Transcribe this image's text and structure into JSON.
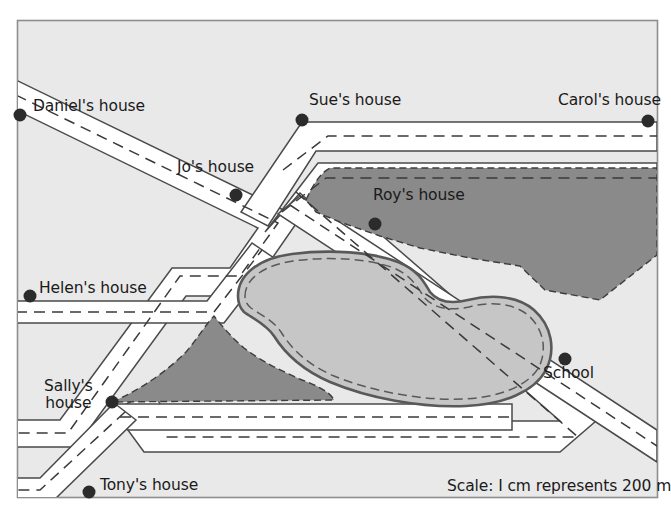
{
  "map": {
    "frame": {
      "x": 17,
      "y": 20,
      "width": 641,
      "height": 478
    },
    "background_color": "#e9e9e9",
    "frame_border_color": "#8e8e8e",
    "road_fill_color": "#ffffff",
    "road_edge_color": "#4a4a4a",
    "road_centerline_color": "#3a3a3a",
    "woodland_color": "#8a8a8a",
    "woodland_edge_color": "#3d3d3d",
    "lake_fill_color": "#c6c6c6",
    "lake_edge_color": "#595959",
    "marker_color": "#2b2b2b",
    "text_color": "#1a1a1a"
  },
  "places": [
    {
      "name": "daniel",
      "label": "Daniel's house",
      "dot_x": 20,
      "dot_y": 115,
      "label_x": 33,
      "label_y": 98,
      "two_line": false
    },
    {
      "name": "sue",
      "label": "Sue's house",
      "dot_x": 302,
      "dot_y": 120,
      "label_x": 309,
      "label_y": 92,
      "two_line": false
    },
    {
      "name": "carol",
      "label": "Carol's house",
      "dot_x": 648,
      "dot_y": 121,
      "label_x": 558,
      "label_y": 92,
      "two_line": false
    },
    {
      "name": "jo",
      "label": "Jo's house",
      "dot_x": 236,
      "dot_y": 195,
      "label_x": 177,
      "label_y": 159,
      "two_line": false
    },
    {
      "name": "roy",
      "label": "Roy's house",
      "dot_x": 375,
      "dot_y": 224,
      "label_x": 373,
      "label_y": 187,
      "two_line": false
    },
    {
      "name": "helen",
      "label": "Helen's house",
      "dot_x": 30,
      "dot_y": 296,
      "label_x": 39,
      "label_y": 280,
      "two_line": false
    },
    {
      "name": "school",
      "label": "School",
      "dot_x": 565,
      "dot_y": 359,
      "label_x": 543,
      "label_y": 365,
      "two_line": false
    },
    {
      "name": "sally",
      "label": "Sally's\nhouse",
      "dot_x": 112,
      "dot_y": 402,
      "label_x": 44,
      "label_y": 378,
      "two_line": true
    },
    {
      "name": "tony",
      "label": "Tony's house",
      "dot_x": 89,
      "dot_y": 492,
      "label_x": 100,
      "label_y": 477,
      "two_line": false
    }
  ],
  "scale": {
    "text": "Scale: I cm represents 200 m",
    "x": 447,
    "y": 477
  }
}
